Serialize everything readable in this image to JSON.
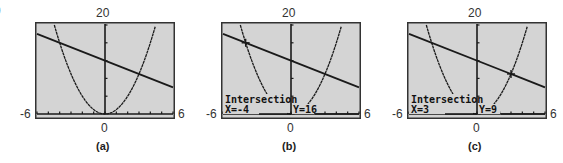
{
  "corner_fragment": "9",
  "colors": {
    "screen_bg": "#d4d4d4",
    "border": "#333333",
    "curve": "#1a1a1a"
  },
  "chart_data": [
    {
      "type": "line",
      "title": "",
      "caption": "(a)",
      "xlim": [
        -6,
        6
      ],
      "ylim": [
        0,
        20
      ],
      "x_tick_labels": {
        "left": "-6",
        "right": "6",
        "center": "0"
      },
      "y_tick_labels": {
        "top": "20"
      },
      "x_tick_step": 1,
      "y_tick_step": 4,
      "grid": false,
      "series": [
        {
          "name": "parabola",
          "equation": "y = x^2",
          "x": [
            -4.47,
            -4,
            -3,
            -2,
            -1,
            0,
            1,
            2,
            3,
            4,
            4.47
          ],
          "y": [
            20,
            16,
            9,
            4,
            1,
            0,
            1,
            4,
            9,
            16,
            20
          ]
        },
        {
          "name": "line",
          "equation": "y = 12 - x",
          "x": [
            -6,
            6
          ],
          "y": [
            18,
            6
          ]
        }
      ],
      "annotation": null
    },
    {
      "type": "line",
      "title": "",
      "caption": "(b)",
      "xlim": [
        -6,
        6
      ],
      "ylim": [
        0,
        20
      ],
      "x_tick_labels": {
        "left": "-6",
        "right": "6",
        "center": "0"
      },
      "y_tick_labels": {
        "top": "20"
      },
      "x_tick_step": 1,
      "y_tick_step": 4,
      "grid": false,
      "series": [
        {
          "name": "parabola",
          "equation": "y = x^2",
          "x": [
            -4.47,
            -4,
            -3,
            -2,
            -1,
            0,
            1,
            2,
            3,
            4,
            4.47
          ],
          "y": [
            20,
            16,
            9,
            4,
            1,
            0,
            1,
            4,
            9,
            16,
            20
          ]
        },
        {
          "name": "line",
          "equation": "y = 12 - x",
          "x": [
            -6,
            6
          ],
          "y": [
            18,
            6
          ]
        }
      ],
      "annotation": {
        "heading": "Intersection",
        "x_text": "X=-4",
        "y_text": "Y=16",
        "point": [
          -4,
          16
        ]
      }
    },
    {
      "type": "line",
      "title": "",
      "caption": "(c)",
      "xlim": [
        -6,
        6
      ],
      "ylim": [
        0,
        20
      ],
      "x_tick_labels": {
        "left": "-6",
        "right": "6",
        "center": "0"
      },
      "y_tick_labels": {
        "top": "20"
      },
      "x_tick_step": 1,
      "y_tick_step": 4,
      "grid": false,
      "series": [
        {
          "name": "parabola",
          "equation": "y = x^2",
          "x": [
            -4.47,
            -4,
            -3,
            -2,
            -1,
            0,
            1,
            2,
            3,
            4,
            4.47
          ],
          "y": [
            20,
            16,
            9,
            4,
            1,
            0,
            1,
            4,
            9,
            16,
            20
          ]
        },
        {
          "name": "line",
          "equation": "y = 12 - x",
          "x": [
            -6,
            6
          ],
          "y": [
            18,
            6
          ]
        }
      ],
      "annotation": {
        "heading": "Intersection",
        "x_text": "X=3",
        "y_text": "Y=9",
        "point": [
          3,
          9
        ]
      }
    }
  ]
}
